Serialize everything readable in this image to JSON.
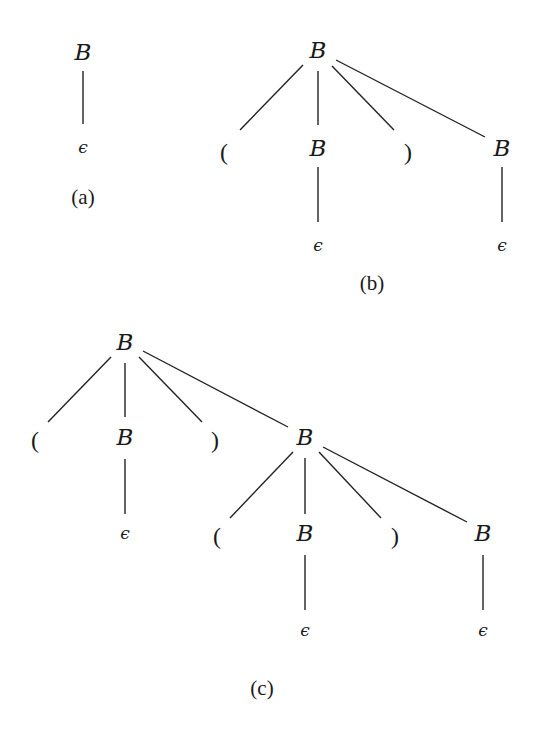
{
  "figure": {
    "stroke_color": "#222222",
    "text_color": "#1a1a1a",
    "background": "#ffffff"
  },
  "trees": [
    {
      "id": "a",
      "caption": "(a)",
      "caption_pos": [
        83,
        197
      ],
      "nodes": [
        {
          "id": "a0",
          "label": "B",
          "kind": "nt",
          "pos": [
            83,
            52
          ]
        },
        {
          "id": "a1",
          "label": "ϵ",
          "kind": "eps",
          "pos": [
            83,
            147
          ]
        }
      ],
      "edges": [
        {
          "from": [
            83,
            71
          ],
          "to": [
            83,
            124
          ]
        }
      ]
    },
    {
      "id": "b",
      "caption": "(b)",
      "caption_pos": [
        372,
        283
      ],
      "nodes": [
        {
          "id": "b0",
          "label": "B",
          "kind": "nt",
          "pos": [
            318,
            50
          ]
        },
        {
          "id": "b1",
          "label": "(",
          "kind": "term",
          "pos": [
            224,
            152
          ]
        },
        {
          "id": "b2",
          "label": "B",
          "kind": "nt",
          "pos": [
            318,
            148
          ]
        },
        {
          "id": "b3",
          "label": ")",
          "kind": "term",
          "pos": [
            408,
            152
          ]
        },
        {
          "id": "b4",
          "label": "B",
          "kind": "nt",
          "pos": [
            502,
            148
          ]
        },
        {
          "id": "b5",
          "label": "ϵ",
          "kind": "eps",
          "pos": [
            318,
            245
          ]
        },
        {
          "id": "b6",
          "label": "ϵ",
          "kind": "eps",
          "pos": [
            502,
            245
          ]
        }
      ],
      "edges": [
        {
          "from": [
            303,
            65
          ],
          "to": [
            240,
            130
          ]
        },
        {
          "from": [
            318,
            71
          ],
          "to": [
            318,
            125
          ]
        },
        {
          "from": [
            332,
            66
          ],
          "to": [
            394,
            130
          ]
        },
        {
          "from": [
            336,
            60
          ],
          "to": [
            485,
            137
          ]
        },
        {
          "from": [
            318,
            167
          ],
          "to": [
            318,
            222
          ]
        },
        {
          "from": [
            502,
            167
          ],
          "to": [
            502,
            222
          ]
        }
      ]
    },
    {
      "id": "c",
      "caption": "(c)",
      "caption_pos": [
        262,
        688
      ],
      "nodes": [
        {
          "id": "c0",
          "label": "B",
          "kind": "nt",
          "pos": [
            125,
            342
          ]
        },
        {
          "id": "c1",
          "label": "(",
          "kind": "term",
          "pos": [
            35,
            440
          ]
        },
        {
          "id": "c2",
          "label": "B",
          "kind": "nt",
          "pos": [
            125,
            437
          ]
        },
        {
          "id": "c3",
          "label": ")",
          "kind": "term",
          "pos": [
            215,
            440
          ]
        },
        {
          "id": "c4",
          "label": "B",
          "kind": "nt",
          "pos": [
            305,
            437
          ]
        },
        {
          "id": "c5",
          "label": "ϵ",
          "kind": "eps",
          "pos": [
            125,
            533
          ]
        },
        {
          "id": "c6",
          "label": "(",
          "kind": "term",
          "pos": [
            217,
            536
          ]
        },
        {
          "id": "c7",
          "label": "B",
          "kind": "nt",
          "pos": [
            305,
            533
          ]
        },
        {
          "id": "c8",
          "label": ")",
          "kind": "term",
          "pos": [
            395,
            536
          ]
        },
        {
          "id": "c9",
          "label": "B",
          "kind": "nt",
          "pos": [
            483,
            533
          ]
        },
        {
          "id": "c10",
          "label": "ϵ",
          "kind": "eps",
          "pos": [
            305,
            630
          ]
        },
        {
          "id": "c11",
          "label": "ϵ",
          "kind": "eps",
          "pos": [
            483,
            630
          ]
        }
      ],
      "edges": [
        {
          "from": [
            111,
            357
          ],
          "to": [
            48,
            422
          ]
        },
        {
          "from": [
            125,
            363
          ],
          "to": [
            125,
            417
          ]
        },
        {
          "from": [
            139,
            357
          ],
          "to": [
            202,
            422
          ]
        },
        {
          "from": [
            143,
            351
          ],
          "to": [
            288,
            427
          ]
        },
        {
          "from": [
            125,
            459
          ],
          "to": [
            125,
            514
          ]
        },
        {
          "from": [
            293,
            452
          ],
          "to": [
            230,
            518
          ]
        },
        {
          "from": [
            305,
            458
          ],
          "to": [
            305,
            514
          ]
        },
        {
          "from": [
            319,
            452
          ],
          "to": [
            381,
            518
          ]
        },
        {
          "from": [
            323,
            447
          ],
          "to": [
            467,
            522
          ]
        },
        {
          "from": [
            305,
            555
          ],
          "to": [
            305,
            610
          ]
        },
        {
          "from": [
            483,
            555
          ],
          "to": [
            483,
            610
          ]
        }
      ]
    }
  ]
}
